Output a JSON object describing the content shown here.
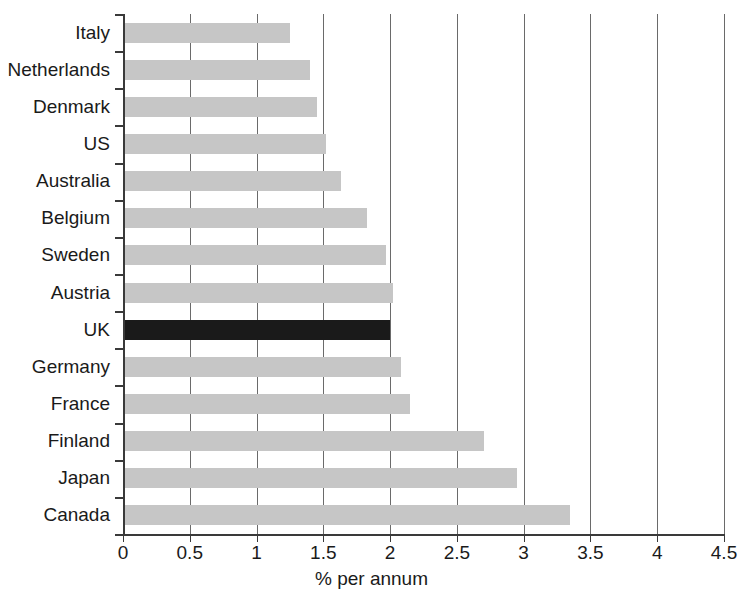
{
  "chart_data": {
    "type": "bar",
    "orientation": "horizontal",
    "title": "",
    "title_remnant": "",
    "xlabel": "% per annum",
    "ylabel": "",
    "xlim": [
      0,
      4.5
    ],
    "xticks": [
      0,
      0.5,
      1,
      1.5,
      2,
      2.5,
      3,
      3.5,
      4,
      4.5
    ],
    "xtick_labels": [
      "0",
      "0.5",
      "1",
      "1.5",
      "2",
      "2.5",
      "3",
      "3.5",
      "4",
      "4.5"
    ],
    "grid": "vertical",
    "legend": "none",
    "categories": [
      "Italy",
      "Netherlands",
      "Denmark",
      "US",
      "Australia",
      "Belgium",
      "Sweden",
      "Austria",
      "UK",
      "Germany",
      "France",
      "Finland",
      "Japan",
      "Canada"
    ],
    "values": [
      1.25,
      1.4,
      1.45,
      1.52,
      1.63,
      1.83,
      1.97,
      2.02,
      2.0,
      2.08,
      2.15,
      2.7,
      2.95,
      3.35
    ],
    "highlight_category": "UK",
    "colors": {
      "bar": "#c6c6c6",
      "bar_highlight": "#1a1a1a",
      "axis": "#3a3a3a",
      "gridline": "#6a6a6a",
      "text": "#1a1a1a",
      "background": "#ffffff"
    }
  }
}
